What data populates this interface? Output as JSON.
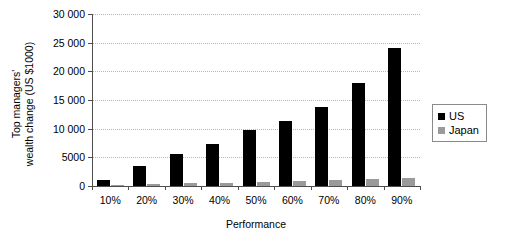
{
  "chart_data": {
    "type": "bar",
    "title": "",
    "xlabel": "Performance",
    "ylabel": "Top managers'\nwealth change (US $1000)",
    "categories": [
      "10%",
      "20%",
      "30%",
      "40%",
      "50%",
      "60%",
      "70%",
      "80%",
      "90%"
    ],
    "series": [
      {
        "name": "US",
        "color": "#000000",
        "values": [
          1100,
          3500,
          5500,
          7400,
          9700,
          11300,
          13700,
          17900,
          24000
        ]
      },
      {
        "name": "Japan",
        "color": "#9a9a9a",
        "values": [
          200,
          300,
          500,
          450,
          700,
          800,
          1000,
          1200,
          1400
        ]
      }
    ],
    "ylim": [
      0,
      30000
    ],
    "ytick_values": [
      0,
      5000,
      10000,
      15000,
      20000,
      25000,
      30000
    ],
    "ytick_labels": [
      "0",
      "5000",
      "10 000",
      "15 000",
      "20 000",
      "25 000",
      "30 000"
    ],
    "grid": true,
    "grid_axis": "y",
    "legend_position": "right",
    "legend_entries": [
      "US",
      "Japan"
    ]
  }
}
